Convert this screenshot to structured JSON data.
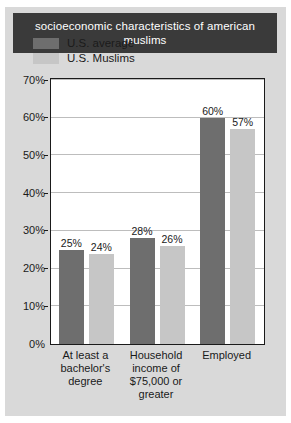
{
  "chart_data": {
    "type": "bar",
    "title": "socioeconomic characteristics of american muslims",
    "categories": [
      "At least a bachelor's degree",
      "Household income of $75,000 or greater",
      "Employed"
    ],
    "series": [
      {
        "name": "U.S. average",
        "values": [
          25,
          28,
          60
        ],
        "color": "#6e6e6e"
      },
      {
        "name": "U.S. Muslims",
        "values": [
          24,
          26,
          57
        ],
        "color": "#c6c6c6"
      }
    ],
    "value_labels": [
      [
        "25%",
        "24%"
      ],
      [
        "28%",
        "26%"
      ],
      [
        "60%",
        "57%"
      ]
    ],
    "xlabel": "",
    "ylabel": "",
    "ylim": [
      0,
      70
    ],
    "ytick_step": 10,
    "ytick_labels": [
      "0%",
      "10%",
      "20%",
      "30%",
      "40%",
      "50%",
      "60%",
      "70%"
    ],
    "grid": true,
    "legend_position": "inside-top-left"
  },
  "figure": {
    "background_color": "#d9d9d9",
    "title_band_color": "#3a3a3a",
    "title_text_color": "#ffffff",
    "plot_background": "#ffffff",
    "plot_border_color": "#1a1a1a",
    "gridline_color": "#bdbdbd"
  }
}
